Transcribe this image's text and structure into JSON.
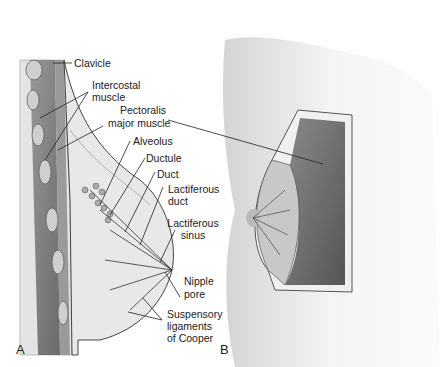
{
  "figure": {
    "panels": [
      {
        "id": "A",
        "label": "A"
      },
      {
        "id": "B",
        "label": "B"
      }
    ],
    "labels": {
      "clavicle": "Clavicle",
      "intercostal_1": "Intercostal",
      "intercostal_2": "muscle",
      "pectoralis_1": "Pectoralis",
      "pectoralis_2": "major muscle",
      "alveolus": "Alveolus",
      "ductule": "Ductule",
      "duct": "Duct",
      "lact_duct_1": "Lactiferous",
      "lact_duct_2": "duct",
      "lact_sinus_1": "Lactiferous",
      "lact_sinus_2": "sinus",
      "nipple_1": "Nipple",
      "nipple_2": "pore",
      "susp_1": "Suspensory",
      "susp_2": "ligaments",
      "susp_3": "of Cooper"
    },
    "colors": {
      "line": "#222222",
      "muscle": "#6b6b6b",
      "tissue": "#d9d9d9",
      "skin": "#ececec"
    }
  }
}
